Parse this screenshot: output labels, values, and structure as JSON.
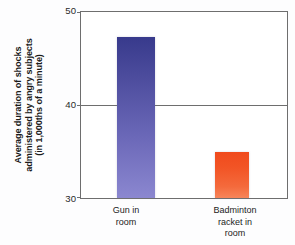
{
  "chart_data": {
    "type": "bar",
    "title": "",
    "subtitle": "",
    "xlabel": "",
    "ylabel": "Average duration of shocks administered by angry subjects (in 1,000ths of a minute)",
    "ylabel_lines": [
      "Average duration of shocks",
      "administered by angry subjects",
      "(in 1,000ths of a minute)"
    ],
    "categories": [
      "Gun in room",
      "Badminton racket in room"
    ],
    "category_lines": [
      [
        "Gun in",
        "room"
      ],
      [
        "Badminton",
        "racket in",
        "room"
      ]
    ],
    "values": [
      47.3,
      34.9
    ],
    "ylim": [
      30,
      50
    ],
    "yticks": [
      50,
      40,
      30
    ],
    "ytick_labels": [
      "50",
      "40",
      "30"
    ],
    "grid": true,
    "gridlines_at": [
      40
    ],
    "legend": "none",
    "bar_colors": [
      "#4a4a9b",
      "#f2551f"
    ],
    "axis_color": "#6e6e6e",
    "background_color": "#fdfdfe"
  }
}
